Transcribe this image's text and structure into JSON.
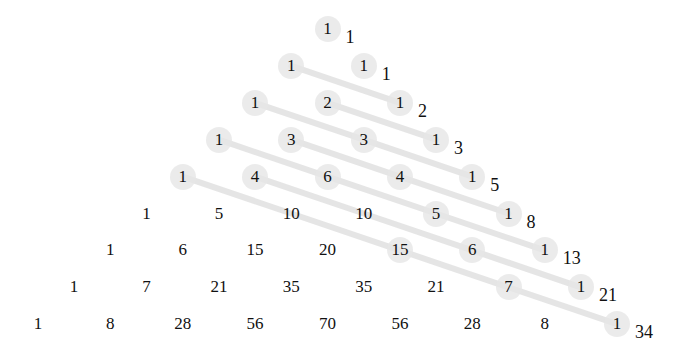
{
  "rows": [
    [
      1
    ],
    [
      1,
      1
    ],
    [
      1,
      2,
      1
    ],
    [
      1,
      3,
      3,
      1
    ],
    [
      1,
      4,
      6,
      4,
      1
    ],
    [
      1,
      5,
      10,
      10,
      5,
      1
    ],
    [
      1,
      6,
      15,
      20,
      15,
      6,
      1
    ],
    [
      1,
      7,
      21,
      35,
      35,
      21,
      7,
      1
    ],
    [
      1,
      8,
      28,
      56,
      70,
      56,
      28,
      8,
      1
    ]
  ],
  "diagonal_sums": [
    1,
    1,
    2,
    3,
    5,
    8,
    13,
    21,
    34
  ],
  "highlighted_cells": [
    [
      0,
      0
    ],
    [
      1,
      0
    ],
    [
      1,
      1
    ],
    [
      2,
      0
    ],
    [
      2,
      1
    ],
    [
      2,
      2
    ],
    [
      3,
      0
    ],
    [
      3,
      1
    ],
    [
      3,
      2
    ],
    [
      3,
      3
    ],
    [
      4,
      0
    ],
    [
      4,
      1
    ],
    [
      4,
      2
    ],
    [
      4,
      3
    ],
    [
      4,
      4
    ],
    [
      5,
      4
    ],
    [
      5,
      5
    ],
    [
      6,
      4
    ],
    [
      6,
      5
    ],
    [
      6,
      6
    ],
    [
      7,
      6
    ],
    [
      7,
      7
    ],
    [
      8,
      8
    ]
  ],
  "diagonals": [
    [
      [
        1,
        0
      ],
      [
        2,
        2
      ]
    ],
    [
      [
        2,
        0
      ],
      [
        3,
        2
      ],
      [
        4,
        4
      ]
    ],
    [
      [
        2,
        1
      ],
      [
        3,
        3
      ]
    ],
    [
      [
        3,
        0
      ],
      [
        4,
        2
      ],
      [
        5,
        4
      ],
      [
        6,
        6
      ]
    ],
    [
      [
        3,
        1
      ],
      [
        4,
        3
      ],
      [
        5,
        5
      ]
    ],
    [
      [
        4,
        0
      ],
      [
        5,
        2
      ],
      [
        6,
        4
      ],
      [
        7,
        6
      ],
      [
        8,
        8
      ]
    ],
    [
      [
        4,
        1
      ],
      [
        5,
        3
      ],
      [
        6,
        5
      ],
      [
        7,
        7
      ]
    ]
  ],
  "colors": {
    "highlight": "#e6e6e6",
    "line": "#dcdcdc",
    "text": "#111111"
  }
}
